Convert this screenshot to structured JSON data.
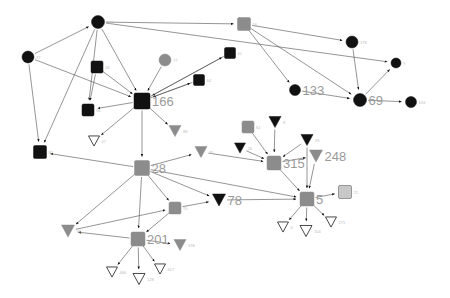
{
  "figure": {
    "kind": "directed-network-graph",
    "width": 450,
    "height": 298,
    "background": "#ffffff"
  },
  "style": {
    "edge_color": "#4d4d4d",
    "edge_width": 0.6,
    "black": "#111111",
    "dark_gray": "#555555",
    "mid_gray": "#8c8c8c",
    "light_gray": "#c8c8c8",
    "outline_stroke": "#333333",
    "label_color_big": "#9a9a9a",
    "label_color_small": "#bbbbbb",
    "label_size_big": 13,
    "label_size_small": 4
  },
  "chart_data": {
    "type": "scatter",
    "title": "",
    "xlabel": "",
    "ylabel": "",
    "node_shapes": [
      "circle",
      "square",
      "triangle-down"
    ],
    "node_fills": [
      "black",
      "dark-gray",
      "mid-gray",
      "light-gray",
      "white"
    ],
    "nodes": [
      {
        "id": "n138",
        "label": "138",
        "x": 98,
        "y": 22,
        "shape": "circle",
        "fill": "black",
        "size": 13,
        "big": false
      },
      {
        "id": "n37",
        "label": "37",
        "x": 28,
        "y": 57,
        "shape": "circle",
        "fill": "black",
        "size": 12,
        "big": false
      },
      {
        "id": "n56",
        "label": "56",
        "x": 244,
        "y": 24,
        "shape": "square",
        "fill": "mid-gray",
        "size": 13,
        "big": false
      },
      {
        "id": "n178",
        "label": "178",
        "x": 352,
        "y": 42,
        "shape": "circle",
        "fill": "black",
        "size": 12,
        "big": false
      },
      {
        "id": "n9",
        "label": "9",
        "x": 396,
        "y": 63,
        "shape": "circle",
        "fill": "black",
        "size": 10,
        "big": false
      },
      {
        "id": "n133",
        "label": "133",
        "x": 295,
        "y": 90,
        "shape": "circle",
        "fill": "black",
        "size": 11,
        "big": true
      },
      {
        "id": "n69",
        "label": "69",
        "x": 360,
        "y": 100,
        "shape": "circle",
        "fill": "black",
        "size": 13,
        "big": true
      },
      {
        "id": "n103",
        "label": "103",
        "x": 411,
        "y": 102,
        "shape": "circle",
        "fill": "black",
        "size": 11,
        "big": false
      },
      {
        "id": "n18",
        "label": "18",
        "x": 97,
        "y": 67,
        "shape": "square",
        "fill": "black",
        "size": 12,
        "big": false
      },
      {
        "id": "n77",
        "label": "77",
        "x": 165,
        "y": 60,
        "shape": "circle",
        "fill": "mid-gray",
        "size": 12,
        "big": false
      },
      {
        "id": "n41",
        "label": "41",
        "x": 230,
        "y": 53,
        "shape": "square",
        "fill": "black",
        "size": 11,
        "big": false
      },
      {
        "id": "n64",
        "label": "64",
        "x": 199,
        "y": 80,
        "shape": "square",
        "fill": "black",
        "size": 11,
        "big": false
      },
      {
        "id": "n166",
        "label": "166",
        "x": 142,
        "y": 101,
        "shape": "square",
        "fill": "black",
        "size": 16,
        "big": true
      },
      {
        "id": "n94",
        "label": "94",
        "x": 88,
        "y": 110,
        "shape": "square",
        "fill": "black",
        "size": 12,
        "big": false
      },
      {
        "id": "n82",
        "label": "82",
        "x": 40,
        "y": 152,
        "shape": "square",
        "fill": "black",
        "size": 13,
        "big": false
      },
      {
        "id": "n47",
        "label": "47",
        "x": 94,
        "y": 141,
        "shape": "triangle-down",
        "fill": "white",
        "size": 11,
        "big": false
      },
      {
        "id": "n88",
        "label": "88",
        "x": 175,
        "y": 131,
        "shape": "triangle-down",
        "fill": "mid-gray",
        "size": 12,
        "big": false
      },
      {
        "id": "n28",
        "label": "28",
        "x": 142,
        "y": 168,
        "shape": "square",
        "fill": "mid-gray",
        "size": 15,
        "big": true
      },
      {
        "id": "n91",
        "label": "91",
        "x": 68,
        "y": 231,
        "shape": "triangle-down",
        "fill": "mid-gray",
        "size": 13,
        "big": false
      },
      {
        "id": "n35",
        "label": "35",
        "x": 201,
        "y": 152,
        "shape": "triangle-down",
        "fill": "mid-gray",
        "size": 12,
        "big": false
      },
      {
        "id": "n61",
        "label": "61",
        "x": 248,
        "y": 127,
        "shape": "square",
        "fill": "mid-gray",
        "size": 12,
        "big": false
      },
      {
        "id": "n8",
        "label": "8",
        "x": 275,
        "y": 122,
        "shape": "triangle-down",
        "fill": "black",
        "size": 12,
        "big": false
      },
      {
        "id": "n26",
        "label": "26",
        "x": 240,
        "y": 148,
        "shape": "triangle-down",
        "fill": "black",
        "size": 11,
        "big": false
      },
      {
        "id": "n33",
        "label": "33",
        "x": 307,
        "y": 140,
        "shape": "triangle-down",
        "fill": "black",
        "size": 12,
        "big": false
      },
      {
        "id": "n315",
        "label": "315",
        "x": 274,
        "y": 163,
        "shape": "square",
        "fill": "mid-gray",
        "size": 14,
        "big": true
      },
      {
        "id": "n248",
        "label": "248",
        "x": 316,
        "y": 156,
        "shape": "triangle-down",
        "fill": "mid-gray",
        "size": 13,
        "big": true
      },
      {
        "id": "n78",
        "label": "78",
        "x": 219,
        "y": 200,
        "shape": "triangle-down",
        "fill": "black",
        "size": 13,
        "big": true
      },
      {
        "id": "n5",
        "label": "5",
        "x": 307,
        "y": 199,
        "shape": "square",
        "fill": "mid-gray",
        "size": 14,
        "big": true
      },
      {
        "id": "n21",
        "label": "21",
        "x": 345,
        "y": 192,
        "shape": "square",
        "fill": "light-gray",
        "size": 13,
        "big": false
      },
      {
        "id": "n70",
        "label": "70",
        "x": 175,
        "y": 208,
        "shape": "square",
        "fill": "mid-gray",
        "size": 12,
        "big": false
      },
      {
        "id": "n201",
        "label": "201",
        "x": 138,
        "y": 239,
        "shape": "square",
        "fill": "mid-gray",
        "size": 14,
        "big": true
      },
      {
        "id": "n198",
        "label": "198",
        "x": 180,
        "y": 245,
        "shape": "triangle-down",
        "fill": "mid-gray",
        "size": 12,
        "big": false
      },
      {
        "id": "n417",
        "label": "417",
        "x": 160,
        "y": 269,
        "shape": "triangle-down",
        "fill": "white",
        "size": 11,
        "big": false
      },
      {
        "id": "n466",
        "label": "466",
        "x": 112,
        "y": 272,
        "shape": "triangle-down",
        "fill": "white",
        "size": 11,
        "big": false
      },
      {
        "id": "n128",
        "label": "128",
        "x": 139,
        "y": 279,
        "shape": "triangle-down",
        "fill": "white",
        "size": 12,
        "big": false
      },
      {
        "id": "n271",
        "label": "271",
        "x": 331,
        "y": 222,
        "shape": "triangle-down",
        "fill": "white",
        "size": 11,
        "big": false
      },
      {
        "id": "n6",
        "label": "6",
        "x": 283,
        "y": 227,
        "shape": "triangle-down",
        "fill": "white",
        "size": 11,
        "big": false
      },
      {
        "id": "n104",
        "label": "104",
        "x": 306,
        "y": 231,
        "shape": "triangle-down",
        "fill": "white",
        "size": 12,
        "big": false
      }
    ],
    "edges": [
      {
        "from": "n138",
        "to": "n56"
      },
      {
        "from": "n37",
        "to": "n138"
      },
      {
        "from": "n37",
        "to": "n82"
      },
      {
        "from": "n37",
        "to": "n166"
      },
      {
        "from": "n138",
        "to": "n82"
      },
      {
        "from": "n138",
        "to": "n166"
      },
      {
        "from": "n138",
        "to": "n94"
      },
      {
        "from": "n138",
        "to": "n9"
      },
      {
        "from": "n18",
        "to": "n94"
      },
      {
        "from": "n18",
        "to": "n166"
      },
      {
        "from": "n77",
        "to": "n166"
      },
      {
        "from": "n41",
        "to": "n166"
      },
      {
        "from": "n64",
        "to": "n166"
      },
      {
        "from": "n56",
        "to": "n178"
      },
      {
        "from": "n56",
        "to": "n69"
      },
      {
        "from": "n56",
        "to": "n133"
      },
      {
        "from": "n178",
        "to": "n69"
      },
      {
        "from": "n69",
        "to": "n9"
      },
      {
        "from": "n69",
        "to": "n103"
      },
      {
        "from": "n133",
        "to": "n69"
      },
      {
        "from": "n166",
        "to": "n94"
      },
      {
        "from": "n166",
        "to": "n88"
      },
      {
        "from": "n166",
        "to": "n47"
      },
      {
        "from": "n166",
        "to": "n28"
      },
      {
        "from": "n166",
        "to": "n41"
      },
      {
        "from": "n28",
        "to": "n82"
      },
      {
        "from": "n28",
        "to": "n91"
      },
      {
        "from": "n28",
        "to": "n35"
      },
      {
        "from": "n28",
        "to": "n201"
      },
      {
        "from": "n28",
        "to": "n70"
      },
      {
        "from": "n28",
        "to": "n78"
      },
      {
        "from": "n28",
        "to": "n5"
      },
      {
        "from": "n61",
        "to": "n315"
      },
      {
        "from": "n8",
        "to": "n315"
      },
      {
        "from": "n26",
        "to": "n315"
      },
      {
        "from": "n33",
        "to": "n315"
      },
      {
        "from": "n35",
        "to": "n315"
      },
      {
        "from": "n315",
        "to": "n5"
      },
      {
        "from": "n248",
        "to": "n5"
      },
      {
        "from": "n5",
        "to": "n21"
      },
      {
        "from": "n5",
        "to": "n6"
      },
      {
        "from": "n5",
        "to": "n104"
      },
      {
        "from": "n5",
        "to": "n271"
      },
      {
        "from": "n78",
        "to": "n5"
      },
      {
        "from": "n70",
        "to": "n201"
      },
      {
        "from": "n70",
        "to": "n78"
      },
      {
        "from": "n201",
        "to": "n198"
      },
      {
        "from": "n201",
        "to": "n466"
      },
      {
        "from": "n201",
        "to": "n128"
      },
      {
        "from": "n201",
        "to": "n417"
      },
      {
        "from": "n201",
        "to": "n91"
      },
      {
        "from": "n91",
        "to": "n70"
      },
      {
        "from": "n315",
        "to": "n248"
      },
      {
        "from": "n166",
        "to": "n64"
      },
      {
        "from": "n33",
        "to": "n5"
      }
    ]
  }
}
